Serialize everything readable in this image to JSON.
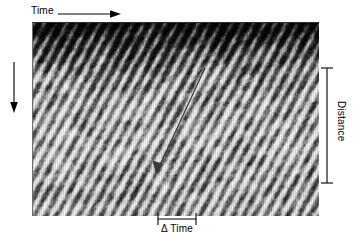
{
  "figure": {
    "type": "space-time-kymograph",
    "axes": {
      "time_label": "Time",
      "space_label": "Space",
      "distance_label": "Distance",
      "delta_time_label": "Δ Time"
    },
    "annotations": {
      "velocity_arrow_name": "velocity-slope-arrow"
    }
  },
  "chart_data": {
    "type": "heatmap",
    "title": "",
    "subtitle": "",
    "xlabel": "Time",
    "ylabel": "Space",
    "colormap": "grayscale",
    "grid": false,
    "legend": null,
    "xlim": [
      0,
      1
    ],
    "ylim": [
      0,
      1
    ],
    "xtick_labels": [],
    "ytick_labels": [],
    "annotations": [
      {
        "name": "time-axis-arrow",
        "text": "Time",
        "direction": "right",
        "x": 0.0,
        "y": 1.08
      },
      {
        "name": "space-axis-arrow",
        "text": "Space",
        "direction": "down",
        "x": -0.09,
        "y": 1.0
      },
      {
        "name": "distance-bracket",
        "text": "Distance",
        "orientation": "vertical",
        "from_y": 0.76,
        "to_y": 0.17
      },
      {
        "name": "delta-time-bracket",
        "text": "Δ Time",
        "orientation": "horizontal",
        "from_x": 0.44,
        "to_x": 0.58
      },
      {
        "name": "velocity-slope-arrow",
        "text": "",
        "from_x": 0.605,
        "from_y": 0.76,
        "to_x": 0.44,
        "to_y": 0.27
      }
    ],
    "texture": {
      "description": "diagonal bright streaks sloping down-left to up-right over dark background",
      "streak_slope": -2.9,
      "n_streaks": 26,
      "dark_band_top": true,
      "value_range": [
        0,
        255
      ]
    },
    "seed": 20240917
  }
}
